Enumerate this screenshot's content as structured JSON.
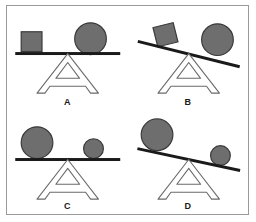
{
  "figure": {
    "type": "balance-scale-diagram",
    "frame_border_color": "#9a9a9a",
    "background_color": "#ffffff"
  },
  "style": {
    "shape_fill": "#6e6e6e",
    "shape_stroke": "#3a3a3a",
    "beam_color": "#1a1a1a",
    "fulcrum_stroke": "#6a6a6a",
    "label_color": "#1a1a1a"
  },
  "panels": [
    {
      "id": "panel-a",
      "label": "A",
      "beam_state": "level",
      "beam_tilt_degrees": 0,
      "left_object": {
        "shape": "square",
        "size": "small",
        "position": "left"
      },
      "right_object": {
        "shape": "circle",
        "size": "large",
        "position": "right"
      },
      "fulcrum": "A-shaped stand"
    },
    {
      "id": "panel-b",
      "label": "B",
      "beam_state": "tilted",
      "beam_tilt_degrees": 14,
      "tilt_direction": "down-right",
      "left_object": {
        "shape": "square",
        "size": "small",
        "position": "left"
      },
      "right_object": {
        "shape": "circle",
        "size": "large",
        "position": "right"
      },
      "fulcrum": "A-shaped stand"
    },
    {
      "id": "panel-c",
      "label": "C",
      "beam_state": "level",
      "beam_tilt_degrees": 0,
      "left_object": {
        "shape": "circle",
        "size": "large",
        "position": "left"
      },
      "right_object": {
        "shape": "circle",
        "size": "small",
        "position": "right"
      },
      "fulcrum": "A-shaped stand"
    },
    {
      "id": "panel-d",
      "label": "D",
      "beam_state": "tilted",
      "beam_tilt_degrees": 12,
      "tilt_direction": "down-right",
      "left_object": {
        "shape": "circle",
        "size": "large",
        "position": "left"
      },
      "right_object": {
        "shape": "circle",
        "size": "small",
        "position": "right"
      },
      "fulcrum": "A-shaped stand"
    }
  ]
}
